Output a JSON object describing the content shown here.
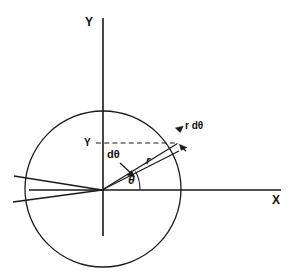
{
  "figure": {
    "type": "polar-coordinate-geometry-diagram",
    "background_color": "#ffffff",
    "stroke_color": "#1a1a1a"
  },
  "axes": {
    "y_axis_label": "Y",
    "x_axis_label": "X",
    "origin_label": ""
  },
  "labels": {
    "y_ordinate": "Y",
    "radius": "r",
    "angle": "θ",
    "angle_increment": "dθ",
    "arc_length": "r dθ"
  },
  "annotations": {
    "arc_element_text": "r dθ",
    "angle_element_text": "dθ",
    "radius_text": "r",
    "theta_text": "θ",
    "height_text": "Y"
  },
  "geometry": {
    "circle_center_x": 103,
    "circle_center_y": 189,
    "circle_radius": 78,
    "origin_x": 103,
    "origin_y": 190,
    "theta_degrees": 29,
    "dtheta_degrees": 5
  }
}
